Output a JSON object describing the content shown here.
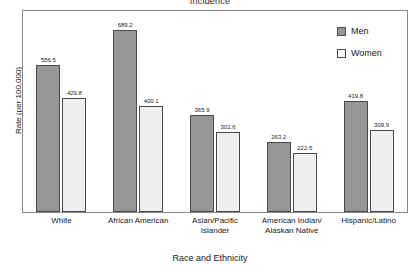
{
  "chart_data": {
    "type": "bar",
    "title": "Incidence",
    "xlabel": "Race and Ethnicity",
    "ylabel": "Rate (per 100,000)",
    "ylim": [
      0,
      760
    ],
    "grid": false,
    "legend_position": "top-right",
    "categories": [
      "White",
      "African American",
      "Asian/Pacific Islander",
      "American Indian/ Alaskan Native",
      "Hispanic/Latino"
    ],
    "category_lines": [
      [
        "White"
      ],
      [
        "African American"
      ],
      [
        "Asian/Pacific",
        "Islander"
      ],
      [
        "American Indian/",
        "Alaskan Native"
      ],
      [
        "Hispanic/Latino"
      ]
    ],
    "series": [
      {
        "name": "Men",
        "color": "#969696",
        "values": [
          556.5,
          689.2,
          365.9,
          263.2,
          419.8
        ],
        "labels": [
          "556.5",
          "689.2",
          "365.9",
          "263.2",
          "419.8"
        ]
      },
      {
        "name": "Women",
        "color": "#efefef",
        "values": [
          429.8,
          400.1,
          302.6,
          222.5,
          309.9
        ],
        "labels": [
          "429.8",
          "400.1",
          "302.6",
          "222.5",
          "309.9"
        ]
      }
    ]
  },
  "legend": {
    "items": [
      {
        "label": "Men",
        "swatch": "men-swatch-icon"
      },
      {
        "label": "Women",
        "swatch": "women-swatch-icon"
      }
    ]
  }
}
